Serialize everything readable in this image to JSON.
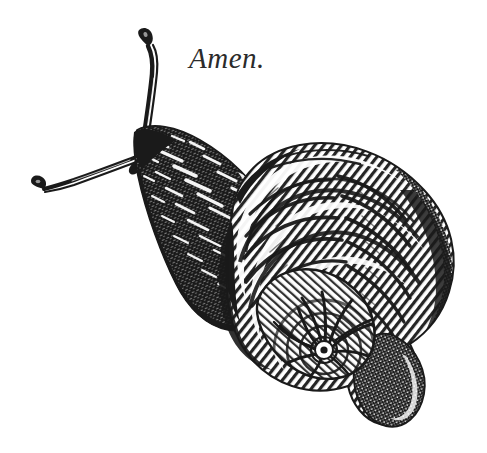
{
  "page": {
    "background_color": "#ffffff",
    "ink_color": "#1a1a1a",
    "width": 487,
    "height": 453
  },
  "caption": {
    "text": "Amen.",
    "color": "#2b2b2b",
    "style": "italic-serif"
  },
  "illustration": {
    "subject": "snail",
    "style": "woodcut-engraving",
    "description": "Black-and-white engraved illustration of a snail crawling toward the upper left, with two extended eye-stalk tentacles and a large spiral shell on its back.",
    "parts": [
      {
        "name": "upper-tentacle",
        "label": "upper eye stalk"
      },
      {
        "name": "lower-tentacle",
        "label": "lower eye stalk"
      },
      {
        "name": "head",
        "label": "head"
      },
      {
        "name": "body",
        "label": "body and foot"
      },
      {
        "name": "shell",
        "label": "spiral shell"
      },
      {
        "name": "shell-apex",
        "label": "shell spiral apex"
      },
      {
        "name": "shell-lip",
        "label": "shell aperture lip"
      }
    ]
  }
}
